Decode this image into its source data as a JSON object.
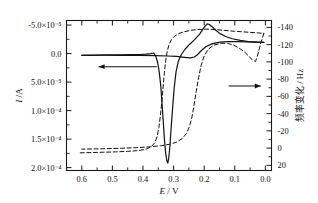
{
  "figure": {
    "background": "#ffffff",
    "frame_color": "#1a1a1a",
    "solid_curve_color": "#111111",
    "dashed_curve_color": "#111111"
  },
  "axes": {
    "x": {
      "label_main": "E",
      "label_sep": " / ",
      "label_unit": "V",
      "ticks": [
        "0.6",
        "0.5",
        "0.4",
        "0.3",
        "0.2",
        "0.1",
        "0.0"
      ],
      "range": [
        0.65,
        -0.02
      ],
      "reversed": true,
      "minor_per_interval": 1
    },
    "y_left": {
      "label_main": "I",
      "label_sep": " /",
      "label_unit": "A",
      "ticks": [
        "-5.0×10⁻⁵",
        "0.0",
        "5.0×10⁻⁵",
        "1.0×10⁻⁴",
        "1.5×10⁻⁴",
        "2.0×10⁻⁴"
      ],
      "tick_values": [
        -5e-05,
        0.0,
        5e-05,
        0.0001,
        0.00015,
        0.0002
      ],
      "range": [
        -5.8e-05,
        0.000205
      ],
      "minor_per_interval": 1
    },
    "y_right": {
      "label_main": "频率变化",
      "label_sep": " / ",
      "label_unit": "Hz",
      "ticks": [
        "-140",
        "-120",
        "-100",
        "-80",
        "-60",
        "-40",
        "-20",
        "0",
        "20"
      ],
      "tick_values": [
        -140,
        -120,
        -100,
        -80,
        -60,
        -40,
        -20,
        0,
        20
      ],
      "range": [
        -148,
        26
      ],
      "minor_per_interval": 1
    }
  },
  "annotations": [
    {
      "name": "left-pointing-arrow",
      "direction": "left",
      "meaning": "solid curve reads left axis",
      "x_from_V": 0.355,
      "x_to_V": 0.545,
      "y_A": 2.3e-05
    },
    {
      "name": "right-pointing-arrow",
      "direction": "right",
      "meaning": "dashed curve reads right axis",
      "x_from_V": 0.12,
      "x_to_V": 0.015,
      "y_Hz": -72
    }
  ],
  "chart_data": {
    "type": "line",
    "title": "",
    "xlabel": "E / V",
    "ylabel": "I / A",
    "ylabel_secondary": "频率变化 / Hz",
    "xlim": [
      0.65,
      -0.02
    ],
    "ylim_left": [
      -5.8e-05,
      0.000205
    ],
    "ylim_right": [
      -148,
      26
    ],
    "grid": false,
    "legend": "none",
    "x_axis_inverted": true,
    "series": [
      {
        "name": "cyclic voltammogram (solid)",
        "style": "solid",
        "axis": "left",
        "units": "A",
        "comment": "Reverse (cathodic-going) sweep 0.6V->0.0V then forward sweep back to 0.6V; sharp cathodic spike near 0.32V and anodic peak near 0.22V",
        "points_sweep1": [
          [
            0.6,
            3e-06
          ],
          [
            0.56,
            2.6e-06
          ],
          [
            0.52,
            2.4e-06
          ],
          [
            0.48,
            2.2e-06
          ],
          [
            0.44,
            2e-06
          ],
          [
            0.41,
            1.6e-06
          ],
          [
            0.39,
            1e-06
          ],
          [
            0.375,
            0.0
          ],
          [
            0.365,
            -1e-06
          ],
          [
            0.358,
            5e-06
          ],
          [
            0.352,
            1.6e-05
          ],
          [
            0.347,
            3.2e-05
          ],
          [
            0.342,
            5.6e-05
          ],
          [
            0.338,
            8.6e-05
          ],
          [
            0.334,
            0.000118
          ],
          [
            0.33,
            0.00015
          ],
          [
            0.326,
            0.000174
          ],
          [
            0.322,
            0.000188
          ],
          [
            0.319,
            0.000192
          ],
          [
            0.316,
            0.000184
          ],
          [
            0.312,
            0.000162
          ],
          [
            0.308,
            0.00013
          ],
          [
            0.303,
            9.4e-05
          ],
          [
            0.298,
            6e-05
          ],
          [
            0.292,
            3.2e-05
          ],
          [
            0.285,
            1.4e-05
          ],
          [
            0.275,
            2e-06
          ],
          [
            0.262,
            -8e-06
          ],
          [
            0.248,
            -1.6e-05
          ],
          [
            0.232,
            -2.4e-05
          ],
          [
            0.215,
            -3.4e-05
          ],
          [
            0.205,
            -4.2e-05
          ],
          [
            0.197,
            -4.8e-05
          ],
          [
            0.19,
            -5.2e-05
          ],
          [
            0.183,
            -5.1e-05
          ],
          [
            0.174,
            -4.7e-05
          ],
          [
            0.162,
            -4.1e-05
          ],
          [
            0.148,
            -3.5e-05
          ],
          [
            0.13,
            -3e-05
          ],
          [
            0.108,
            -2.6e-05
          ],
          [
            0.082,
            -2.3e-05
          ],
          [
            0.055,
            -2.1e-05
          ],
          [
            0.028,
            -2e-05
          ],
          [
            0.005,
            -1.95e-05
          ]
        ],
        "points_sweep2": [
          [
            0.005,
            -1.95e-05
          ],
          [
            0.03,
            -2e-05
          ],
          [
            0.06,
            -2.05e-05
          ],
          [
            0.09,
            -2.1e-05
          ],
          [
            0.12,
            -2.1e-05
          ],
          [
            0.15,
            -2e-05
          ],
          [
            0.175,
            -1.7e-05
          ],
          [
            0.195,
            -1.2e-05
          ],
          [
            0.21,
            -5e-06
          ],
          [
            0.222,
            2e-06
          ],
          [
            0.232,
            6e-06
          ],
          [
            0.245,
            7.5e-06
          ],
          [
            0.265,
            6.5e-06
          ],
          [
            0.29,
            5e-06
          ],
          [
            0.32,
            4.2e-06
          ],
          [
            0.36,
            3.6e-06
          ],
          [
            0.41,
            3.2e-06
          ],
          [
            0.47,
            3e-06
          ],
          [
            0.53,
            2.9e-06
          ],
          [
            0.6,
            3e-06
          ]
        ]
      },
      {
        "name": "frequency change (dashed)",
        "style": "dashed",
        "axis": "right",
        "units": "Hz",
        "comment": "Flat near +5 Hz from 0.6V, drops steeply at 0.34V to about -138 Hz, then recovers on return sweep peaking near -100 Hz at 0.03V",
        "points_sweep1": [
          [
            0.605,
            5.5
          ],
          [
            0.57,
            5.2
          ],
          [
            0.53,
            4.8
          ],
          [
            0.49,
            4.4
          ],
          [
            0.45,
            3.8
          ],
          [
            0.42,
            3.0
          ],
          [
            0.4,
            2.0
          ],
          [
            0.385,
            0.5
          ],
          [
            0.372,
            -2.0
          ],
          [
            0.362,
            -6.0
          ],
          [
            0.354,
            -13.0
          ],
          [
            0.348,
            -24.0
          ],
          [
            0.343,
            -38.0
          ],
          [
            0.338,
            -55.0
          ],
          [
            0.334,
            -72.0
          ],
          [
            0.33,
            -88.0
          ],
          [
            0.326,
            -101.0
          ],
          [
            0.321,
            -112.0
          ],
          [
            0.315,
            -120.0
          ],
          [
            0.307,
            -126.0
          ],
          [
            0.296,
            -130.0
          ],
          [
            0.282,
            -133.0
          ],
          [
            0.265,
            -135.0
          ],
          [
            0.245,
            -136.5
          ],
          [
            0.222,
            -137.5
          ],
          [
            0.195,
            -138.0
          ],
          [
            0.165,
            -137.5
          ],
          [
            0.135,
            -136.5
          ],
          [
            0.1,
            -135.5
          ],
          [
            0.06,
            -134.5
          ],
          [
            0.02,
            -133.5
          ],
          [
            0.005,
            -133.0
          ]
        ],
        "points_sweep2": [
          [
            0.005,
            -133.0
          ],
          [
            0.015,
            -122.0
          ],
          [
            0.025,
            -108.0
          ],
          [
            0.032,
            -100.5
          ],
          [
            0.042,
            -102.0
          ],
          [
            0.055,
            -107.0
          ],
          [
            0.07,
            -112.0
          ],
          [
            0.086,
            -116.0
          ],
          [
            0.104,
            -119.5
          ],
          [
            0.124,
            -121.5
          ],
          [
            0.146,
            -121.5
          ],
          [
            0.168,
            -119.5
          ],
          [
            0.186,
            -115.0
          ],
          [
            0.2,
            -107.0
          ],
          [
            0.21,
            -96.0
          ],
          [
            0.218,
            -82.0
          ],
          [
            0.226,
            -66.0
          ],
          [
            0.233,
            -50.0
          ],
          [
            0.24,
            -36.0
          ],
          [
            0.248,
            -25.0
          ],
          [
            0.258,
            -17.0
          ],
          [
            0.272,
            -11.0
          ],
          [
            0.29,
            -7.0
          ],
          [
            0.312,
            -4.5
          ],
          [
            0.34,
            -2.8
          ],
          [
            0.375,
            -1.5
          ],
          [
            0.42,
            -0.5
          ],
          [
            0.47,
            0.2
          ],
          [
            0.53,
            0.8
          ],
          [
            0.6,
            1.2
          ]
        ]
      }
    ]
  }
}
